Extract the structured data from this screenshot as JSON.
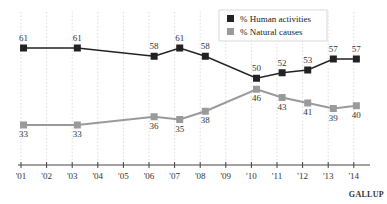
{
  "chart_data": {
    "type": "line",
    "title": "",
    "xlabel": "",
    "ylabel": "",
    "x_ticks": [
      "'01",
      "'02",
      "'03",
      "'04",
      "'05",
      "'06",
      "'07",
      "'08",
      "'09",
      "'10",
      "'11",
      "'12",
      "'13",
      "'14"
    ],
    "ylim": [
      20,
      75
    ],
    "grid": "vertical-dotted",
    "legend_position": "top-center",
    "series": [
      {
        "name": "% Human activities",
        "color": "#222222",
        "points": [
          {
            "x": 2001.1,
            "label": "'01",
            "value": 61
          },
          {
            "x": 2003.2,
            "label": "'03",
            "value": 61
          },
          {
            "x": 2006.2,
            "label": "'06",
            "value": 58
          },
          {
            "x": 2007.2,
            "label": "'07",
            "value": 61
          },
          {
            "x": 2008.2,
            "label": "'08",
            "value": 58
          },
          {
            "x": 2010.2,
            "label": "'10",
            "value": 50
          },
          {
            "x": 2011.2,
            "label": "'11",
            "value": 52
          },
          {
            "x": 2012.2,
            "label": "'12",
            "value": 53
          },
          {
            "x": 2013.2,
            "label": "'13",
            "value": 57
          },
          {
            "x": 2014.1,
            "label": "'14",
            "value": 57
          }
        ]
      },
      {
        "name": "% Natural causes",
        "color": "#9a9a9a",
        "points": [
          {
            "x": 2001.1,
            "label": "'01",
            "value": 33
          },
          {
            "x": 2003.2,
            "label": "'03",
            "value": 33
          },
          {
            "x": 2006.2,
            "label": "'06",
            "value": 36
          },
          {
            "x": 2007.2,
            "label": "'07",
            "value": 35
          },
          {
            "x": 2008.2,
            "label": "'08",
            "value": 38
          },
          {
            "x": 2010.2,
            "label": "'10",
            "value": 46
          },
          {
            "x": 2011.2,
            "label": "'11",
            "value": 43
          },
          {
            "x": 2012.2,
            "label": "'12",
            "value": 41
          },
          {
            "x": 2013.2,
            "label": "'13",
            "value": 39
          },
          {
            "x": 2014.1,
            "label": "'14",
            "value": 40
          }
        ]
      }
    ],
    "source": "GALLUP"
  }
}
